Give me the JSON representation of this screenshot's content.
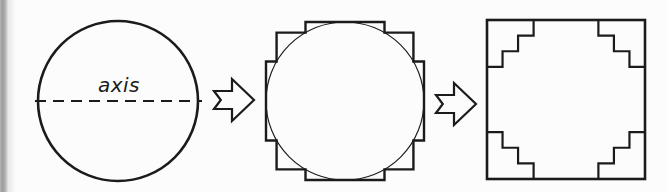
{
  "figure": {
    "background_color": "#fbfbfb",
    "ink_color": "#1b1b1b",
    "scan_edge_color": "#9e9e9e",
    "width": 668,
    "height": 192
  },
  "panels": [
    {
      "id": "circle-panel",
      "name": "circle-with-axis",
      "caption": "",
      "axis_label": "axis",
      "shape": "circle",
      "center": [
        118,
        101
      ],
      "radius": 80,
      "axis": {
        "style": "dashed",
        "y": 101,
        "x_start": 35,
        "x_end": 202,
        "dash_pattern": "11 7"
      }
    },
    {
      "id": "stepped-circle-panel",
      "name": "circle-with-staircase-polygon",
      "caption": "",
      "shape": "circle-with-circumscribed-staircase",
      "center": [
        345,
        101
      ],
      "radius": 79,
      "steps_per_quadrant": 3
    },
    {
      "id": "square-panel",
      "name": "square-with-corner-staircases",
      "caption": "",
      "shape": "square-with-staircase-corners",
      "bounds": [
        487,
        20,
        158,
        159
      ],
      "steps_per_corner": 3
    }
  ],
  "arrows": [
    {
      "id": "arrow-1",
      "name": "transform-arrow-1",
      "direction": "right",
      "x": 214,
      "y": 79,
      "width": 40,
      "height": 42
    },
    {
      "id": "arrow-2",
      "name": "transform-arrow-2",
      "direction": "right",
      "x": 436,
      "y": 83,
      "width": 40,
      "height": 42
    }
  ]
}
